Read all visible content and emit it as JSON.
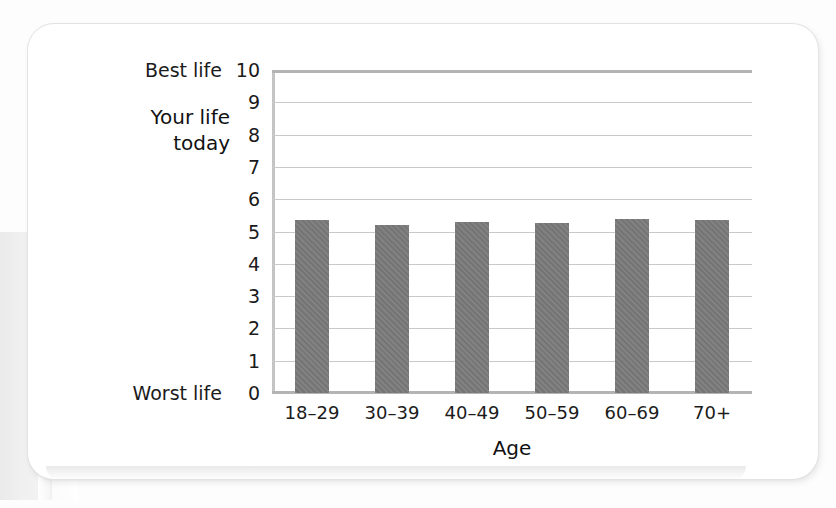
{
  "chart_data": {
    "type": "bar",
    "title": "",
    "categories": [
      "18–29",
      "30–39",
      "40–49",
      "50–59",
      "60–69",
      "70+"
    ],
    "values": [
      5.35,
      5.2,
      5.3,
      5.25,
      5.4,
      5.35
    ],
    "xlabel": "Age",
    "ylabel": "Your life today",
    "ylim": [
      0,
      10
    ],
    "yticks": [
      10,
      9,
      8,
      7,
      6,
      5,
      4,
      3,
      2,
      1,
      0
    ],
    "y_axis_endpoint_labels": {
      "max": "Best life",
      "min": "Worst life"
    },
    "grid": true,
    "legend": false,
    "bar_color": "#7a7a7a",
    "gridline_color": "#c9c9c9",
    "axis_rule_color": "#b4b4b4"
  },
  "axis": {
    "y_title_line1": "Your life",
    "y_title_line2": "today"
  }
}
